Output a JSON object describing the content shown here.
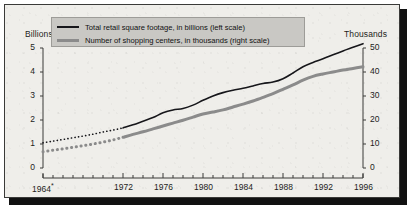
{
  "chart_data": {
    "type": "line",
    "title": "",
    "subtitle": "",
    "xlabel": "",
    "ylabel": "Billions",
    "ylabel_right": "Thousands",
    "xlim": [
      1964,
      1996
    ],
    "ylim": [
      0,
      5
    ],
    "ylim_right": [
      0,
      50
    ],
    "grid": false,
    "legend_position": "top-left",
    "x_tick_labels": [
      "1964*",
      "1972",
      "1976",
      "1980",
      "1984",
      "1988",
      "1992",
      "1996"
    ],
    "x_tick_values": [
      1964,
      1972,
      1976,
      1980,
      1984,
      1988,
      1992,
      1996
    ],
    "y_tick_labels_left": [
      "5",
      "4",
      "3",
      "2",
      "1",
      "0"
    ],
    "y_tick_values_left": [
      5,
      4,
      3,
      2,
      1,
      0
    ],
    "y_tick_labels_right": [
      "50",
      "40",
      "30",
      "20",
      "10",
      "0"
    ],
    "y_tick_values_right": [
      50,
      40,
      30,
      20,
      10,
      0
    ],
    "x_minor_tick_interval": 1,
    "footnote_marker": "*",
    "series": [
      {
        "name": "Total retail square footage, in billions (left scale)",
        "axis": "left",
        "color": "#16161a",
        "line_width": 1.6,
        "estimated_segment": {
          "from": 1964,
          "to": 1972,
          "style": "dotted"
        },
        "x": [
          1964,
          1965,
          1966,
          1967,
          1968,
          1969,
          1970,
          1971,
          1972,
          1973,
          1974,
          1975,
          1976,
          1977,
          1978,
          1979,
          1980,
          1981,
          1982,
          1983,
          1984,
          1985,
          1986,
          1987,
          1988,
          1989,
          1990,
          1991,
          1992,
          1993,
          1994,
          1995,
          1996
        ],
        "values": [
          1.05,
          1.12,
          1.19,
          1.26,
          1.33,
          1.41,
          1.5,
          1.58,
          1.67,
          1.8,
          1.95,
          2.1,
          2.3,
          2.42,
          2.48,
          2.62,
          2.82,
          3.0,
          3.14,
          3.24,
          3.32,
          3.42,
          3.52,
          3.58,
          3.72,
          3.96,
          4.22,
          4.4,
          4.55,
          4.72,
          4.88,
          5.03,
          5.18
        ]
      },
      {
        "name": "Number of shopping centers, in thousands (right scale)",
        "axis": "right",
        "color": "#8b8b8b",
        "line_width": 3,
        "estimated_segment": {
          "from": 1964,
          "to": 1972,
          "style": "dotted"
        },
        "x": [
          1964,
          1965,
          1966,
          1967,
          1968,
          1969,
          1970,
          1971,
          1972,
          1973,
          1974,
          1975,
          1976,
          1977,
          1978,
          1979,
          1980,
          1981,
          1982,
          1983,
          1984,
          1985,
          1986,
          1987,
          1988,
          1989,
          1990,
          1991,
          1992,
          1993,
          1994,
          1995,
          1996
        ],
        "values": [
          6.8,
          7.4,
          8.0,
          8.6,
          9.3,
          10.0,
          10.8,
          11.7,
          12.8,
          14.0,
          15.1,
          16.3,
          17.5,
          18.7,
          19.9,
          21.2,
          22.5,
          23.3,
          24.2,
          25.4,
          26.6,
          27.9,
          29.4,
          31.0,
          32.8,
          34.6,
          36.6,
          38.2,
          39.2,
          40.0,
          40.8,
          41.5,
          42.2
        ]
      }
    ],
    "legend_entries": [
      {
        "label": "Total retail square footage, in billions (left scale)",
        "color": "#16161a",
        "style": "thin-black-line"
      },
      {
        "label": "Number of shopping centers, in thousands (right scale)",
        "color": "#8b8b8b",
        "style": "thick-gray-line"
      }
    ]
  },
  "colors": {
    "panel_background": "#efeeea",
    "panel_border": "#3a3a38",
    "legend_background": "#c9c8c4",
    "legend_border": "#9d9c98",
    "axis": "#3a3a38",
    "series_1": "#16161a",
    "series_2": "#8b8b8b",
    "shadow": "#111111"
  }
}
